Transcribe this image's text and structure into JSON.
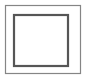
{
  "canvas": {
    "width": 88,
    "height": 81,
    "background_color": "#ffffff"
  },
  "figure": {
    "name": "nested-rectangles-symbol",
    "shapes": [
      {
        "id": "outer-rectangle",
        "type": "rect",
        "x": 5.5,
        "y": 5.5,
        "width": 75,
        "height": 68,
        "stroke_color": "#858585",
        "stroke_width": 1.2,
        "fill_color": "none"
      },
      {
        "id": "inner-rectangle",
        "type": "rect",
        "x": 14,
        "y": 15,
        "width": 54,
        "height": 51,
        "stroke_color": "#565656",
        "stroke_width": 2.2,
        "fill_color": "#ffffff"
      }
    ],
    "interior": {
      "fill_color": "#ffffff",
      "content": ""
    }
  }
}
